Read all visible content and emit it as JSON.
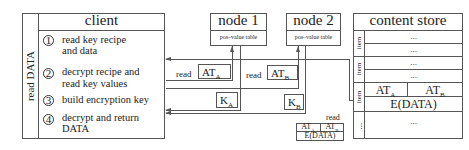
{
  "client": {
    "title": "client",
    "side_label": "read DATA",
    "steps": [
      {
        "num": "1",
        "line1": "read key recipe",
        "line2": "and data"
      },
      {
        "num": "2",
        "line1": "decrypt recipe and",
        "line2": "read key values"
      },
      {
        "num": "3",
        "line1": "build encryption key",
        "line2": ""
      },
      {
        "num": "4",
        "line1": "decrypt and return",
        "line2": "DATA"
      }
    ]
  },
  "node1": {
    "title": "node 1",
    "table_label": "pos–value table"
  },
  "node2": {
    "title": "node 2",
    "table_label": "pos–value table"
  },
  "messages": {
    "read_a_label": "read",
    "at_a": "AT",
    "at_a_sub": "A",
    "read_b_label": "read",
    "at_b": "AT",
    "at_b_sub": "B",
    "k_a": "K",
    "k_a_sub": "A",
    "k_b": "K",
    "k_b_sub": "B",
    "read_data_label": "read",
    "packet_at_a": "AT",
    "packet_at_a_sub": "A",
    "packet_at_b": "AT",
    "packet_at_b_sub": "B",
    "packet_data": "E(DATA)"
  },
  "content_store": {
    "title": "content store",
    "item_label": "item",
    "ellipsis": "...",
    "target_at_a": "AT",
    "target_at_a_sub": "A",
    "target_at_b": "AT",
    "target_at_b_sub": "B",
    "target_data": "E(DATA)",
    "last_label": "..."
  }
}
